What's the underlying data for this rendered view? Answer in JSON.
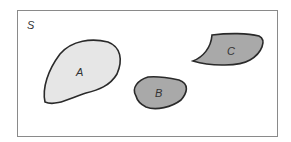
{
  "diagram": {
    "type": "venn",
    "sample_space_label": "S",
    "sets": [
      {
        "label": "A",
        "fill": "#e6e6e6"
      },
      {
        "label": "B",
        "fill": "#a9a9a9"
      },
      {
        "label": "C",
        "fill": "#a9a9a9"
      }
    ],
    "colors": {
      "frame": "#8a8a8a",
      "outline": "#2a2a2a",
      "background": "#ffffff"
    }
  }
}
